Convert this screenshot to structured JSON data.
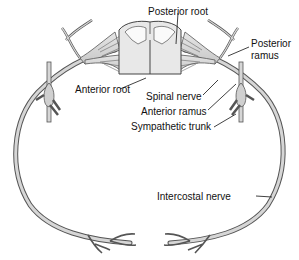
{
  "diagram": {
    "type": "anatomical",
    "colors": {
      "nerve_fill": "#d8d8d8",
      "nerve_stroke": "#555555",
      "cord_fill": "#e8e8e8",
      "label": "#111111",
      "background": "#ffffff"
    },
    "labels": {
      "posterior_root": "Posterior root",
      "posterior_ramus_line1": "Posterior",
      "posterior_ramus_line2": "ramus",
      "anterior_root": "Anterior root",
      "spinal_nerve": "Spinal nerve",
      "anterior_ramus": "Anterior ramus",
      "sympathetic_trunk": "Sympathetic trunk",
      "intercostal_nerve": "Intercostal nerve"
    }
  }
}
